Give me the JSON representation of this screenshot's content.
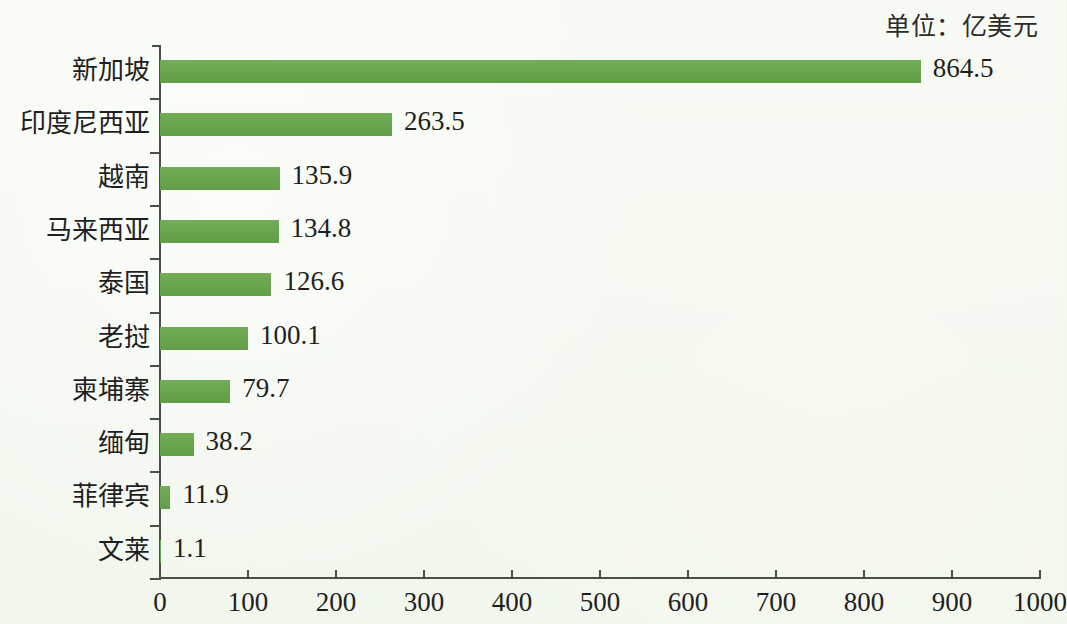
{
  "annotations": {
    "unit_note": "单位：亿美元"
  },
  "chart_data": {
    "type": "bar",
    "orientation": "horizontal",
    "title": "",
    "subtitle": "",
    "xlabel": "",
    "ylabel": "",
    "unit_note": "单位：亿美元",
    "categories": [
      "新加坡",
      "印度尼西亚",
      "越南",
      "马来西亚",
      "泰国",
      "老挝",
      "柬埔寨",
      "缅甸",
      "菲律宾",
      "文莱"
    ],
    "values": [
      864.5,
      263.5,
      135.9,
      134.8,
      126.6,
      100.1,
      79.7,
      38.2,
      11.9,
      1.1
    ],
    "value_labels": [
      "864.5",
      "263.5",
      "135.9",
      "134.8",
      "126.6",
      "100.1",
      "79.7",
      "38.2",
      "11.9",
      "1.1"
    ],
    "xlim": [
      0,
      1000
    ],
    "xticks": [
      0,
      100,
      200,
      300,
      400,
      500,
      600,
      700,
      800,
      900,
      1000
    ],
    "xtick_labels": [
      "0",
      "100",
      "200",
      "300",
      "400",
      "500",
      "600",
      "700",
      "800",
      "900",
      "1000"
    ],
    "grid": false,
    "legend": null,
    "bar_color": "#6aa84f",
    "background_color": "#f2f7ee",
    "axis_color": "#4a4f48",
    "text_color": "#1f1f1f"
  }
}
